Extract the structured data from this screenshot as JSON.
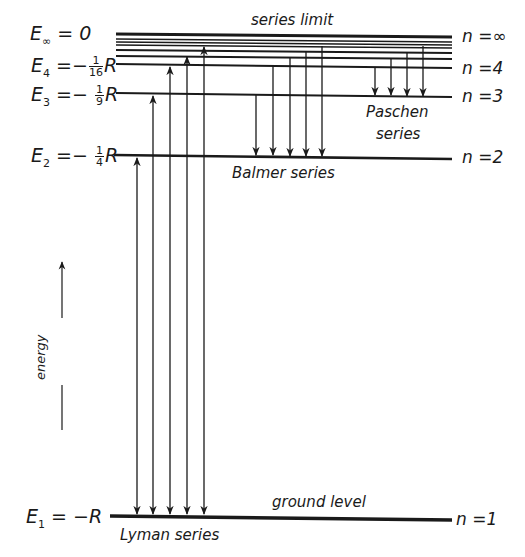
{
  "levels": [
    {
      "n_label": "n =∞",
      "energy_label": "0",
      "E_sym": "E",
      "E_sub": "∞",
      "y": 36
    },
    {
      "n_label": "n =4",
      "energy_label": "R",
      "E_sym": "E",
      "E_sub": "4",
      "frac_num": "1",
      "frac_den": "16",
      "y": 66
    },
    {
      "n_label": "n =3",
      "energy_label": "R",
      "E_sym": "E",
      "E_sub": "3",
      "frac_num": "1",
      "frac_den": "9",
      "y": 95
    },
    {
      "n_label": "n =2",
      "energy_label": "R",
      "E_sym": "E",
      "E_sub": "2",
      "frac_num": "1",
      "frac_den": "4",
      "y": 156
    },
    {
      "n_label": "n =1",
      "energy_label": "R",
      "E_sym": "E",
      "E_sub": "1",
      "y": 518
    }
  ],
  "labels": {
    "series_limit": "series limit",
    "paschen_line1": "Paschen",
    "paschen_line2": "series",
    "balmer": "Balmer series",
    "lyman": "Lyman series",
    "ground_level": "ground level",
    "energy_axis": "energy",
    "e_inf_eq": "= 0",
    "eq_minus": "=−",
    "e1_eq": "= −R"
  },
  "series": [
    {
      "name": "Lyman series",
      "lower_n": 1,
      "upper_n": [
        2,
        3,
        4,
        5,
        6
      ],
      "direction": "both"
    },
    {
      "name": "Balmer series",
      "lower_n": 2,
      "upper_n": [
        3,
        4,
        5,
        6,
        7
      ],
      "direction": "down"
    },
    {
      "name": "Paschen series",
      "lower_n": 3,
      "upper_n": [
        4,
        5,
        6,
        7
      ],
      "direction": "down"
    }
  ],
  "colors": {
    "ink": "#1a1a1a",
    "background": "#ffffff"
  }
}
